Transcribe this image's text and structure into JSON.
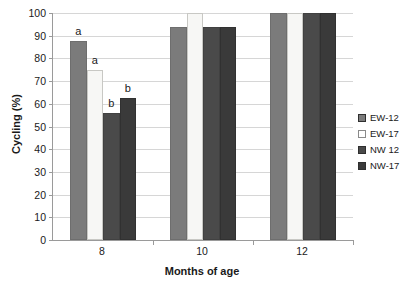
{
  "chart_data": {
    "type": "bar",
    "title": "",
    "xlabel": "Months of age",
    "ylabel": "Cycling (%)",
    "categories": [
      "8",
      "10",
      "12"
    ],
    "ylim": [
      0,
      100
    ],
    "yticks": [
      0,
      10,
      20,
      30,
      40,
      50,
      60,
      70,
      80,
      90,
      100
    ],
    "grid": true,
    "legend_position": "right",
    "series": [
      {
        "name": "EW-12",
        "color": "#7b7b7b",
        "values": [
          87.5,
          94,
          100
        ]
      },
      {
        "name": "EW-17",
        "color": "#f7f7f5",
        "values": [
          75,
          100,
          100
        ]
      },
      {
        "name": "NW 12",
        "color": "#4a4a4a",
        "values": [
          56,
          94,
          100
        ]
      },
      {
        "name": "NW-17",
        "color": "#3a3a3a",
        "values": [
          62.5,
          94,
          100
        ]
      }
    ],
    "annotations": [
      {
        "category": "8",
        "series": "EW-12",
        "text": "a"
      },
      {
        "category": "8",
        "series": "EW-17",
        "text": "a"
      },
      {
        "category": "8",
        "series": "NW 12",
        "text": "b"
      },
      {
        "category": "8",
        "series": "NW-17",
        "text": "b"
      }
    ]
  },
  "legend": {
    "items": [
      {
        "label": "EW-12",
        "swatch": "#7b7b7b"
      },
      {
        "label": "EW-17",
        "swatch": "#ffffff"
      },
      {
        "label": "NW 12",
        "swatch": "#4a4a4a"
      },
      {
        "label": "NW-17",
        "swatch": "#3a3a3a"
      }
    ]
  }
}
